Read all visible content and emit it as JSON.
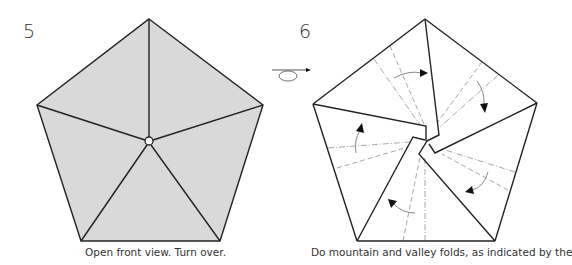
{
  "steps": [
    {
      "number": "5",
      "caption": "Open front view. Turn over.",
      "figure": "pentagon-grey-radial-creases"
    },
    {
      "number": "6",
      "caption": "Do mountain and valley folds, as indicated by the",
      "figure": "pentagon-flaps-with-fold-lines"
    }
  ],
  "symbols": {
    "turn_over": "turn-over-arrow"
  },
  "colors": {
    "paper_back": "#d9d9d9",
    "paper_front": "#ffffff",
    "line": "#222222",
    "fold_line": "#a8a8a8"
  }
}
